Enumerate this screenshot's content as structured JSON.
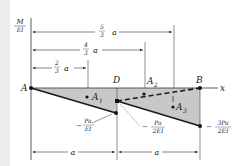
{
  "diagram": {
    "y_axis_label": {
      "num": "M",
      "den": "EI"
    },
    "x_axis_label": "x",
    "points": {
      "A": "A",
      "D": "D",
      "B": "B"
    },
    "areas": {
      "A1": "A",
      "A1_sub": "1",
      "A2": "A",
      "A2_sub": "2",
      "A3": "A",
      "A3_sub": "3"
    },
    "dimensions": {
      "d53": {
        "num": "5",
        "den": "3",
        "var": "a"
      },
      "d43": {
        "num": "4",
        "den": "3",
        "var": "a"
      },
      "d23": {
        "num": "2",
        "den": "3",
        "var": "a"
      },
      "bottom_left": "a",
      "bottom_right": "a"
    },
    "values": {
      "v1": {
        "sign": "−",
        "num": "Pa",
        "den": "EI"
      },
      "v2": {
        "sign": "−",
        "num": "Pa",
        "den": "2EI"
      },
      "v3": {
        "sign": "−",
        "num": "3Pa",
        "den": "2EI"
      }
    },
    "colors": {
      "fill": "#c8c8c8",
      "line": "#1a1a1a",
      "band": "#ececec"
    }
  }
}
